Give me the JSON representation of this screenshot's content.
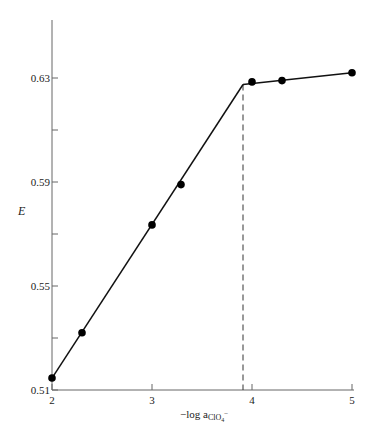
{
  "chart_data": {
    "type": "line",
    "title": "",
    "xlabel": "−log a",
    "xlabel_sub": "ClO",
    "xlabel_sub2": "4",
    "xlabel_sup": "−",
    "ylabel": "E",
    "xlim": [
      2,
      5
    ],
    "ylim": [
      0.51,
      0.65
    ],
    "x_ticks": [
      2,
      3,
      4,
      5
    ],
    "x_tick_labels": [
      "2",
      "3",
      "4",
      "5"
    ],
    "y_ticks": [
      0.51,
      0.53,
      0.55,
      0.57,
      0.59,
      0.61,
      0.63
    ],
    "y_tick_labels": [
      "0.51",
      "",
      "0.55",
      "",
      "0.59",
      "",
      "0.63"
    ],
    "grid": false,
    "series": [
      {
        "name": "measured E",
        "marker": "filled-circle",
        "x": [
          2.0,
          2.3,
          3.0,
          3.29,
          4.0,
          4.3,
          5.0
        ],
        "y": [
          0.5146,
          0.532,
          0.5735,
          0.589,
          0.6285,
          0.629,
          0.632
        ]
      }
    ],
    "fit_lines": [
      {
        "x": [
          2.0,
          3.91
        ],
        "y": [
          0.5146,
          0.6275
        ]
      },
      {
        "x": [
          3.91,
          5.0
        ],
        "y": [
          0.6275,
          0.632
        ]
      }
    ],
    "annotations": [
      {
        "type": "vertical-dashed-line",
        "x": 3.91,
        "label": "end point"
      }
    ]
  }
}
